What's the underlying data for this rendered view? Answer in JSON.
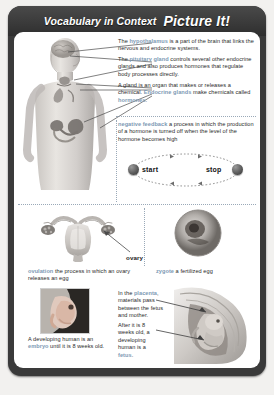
{
  "header": {
    "title_script": "Vocabulary in Context",
    "title_bold": "Picture It!"
  },
  "accent_colors": {
    "term_highlight": "#7d99b4",
    "frame": "#3a3a3a",
    "page": "#ffffff",
    "divider": "#9aa9b8"
  },
  "endocrine_section": {
    "entries": [
      {
        "id": "hypothalamus",
        "lead": "The ",
        "term": "hypothalamus",
        "body": " is a part of the brain that links the nervous and endocrine systems."
      },
      {
        "id": "pituitary-gland",
        "lead": "The ",
        "term": "pituitary gland",
        "body": " controls several other endocrine glands and also produces hormones that regulate body processes directly."
      },
      {
        "id": "gland",
        "lead": "A gland is an organ that makes or releases a chemical. ",
        "term": "Endocrine glands",
        "body": " make chemicals called ",
        "term2": "hormones",
        "body2": "."
      }
    ],
    "body_figure_label": "human-endocrine-system-figure"
  },
  "negative_feedback": {
    "term": "negative feedback",
    "definition": " a process in which the production of a hormone is turned off when the level of the hormone becomes high",
    "loop": {
      "start_label": "start",
      "stop_label": "stop"
    }
  },
  "reproduction_section": {
    "ovary_label": "ovary",
    "ovulation": {
      "term": "ovulation",
      "definition": " the process in which an ovary releases an egg"
    },
    "zygote": {
      "term": "zygote",
      "definition": " a fertilized egg"
    }
  },
  "development_section": {
    "placenta": {
      "lead": "In the ",
      "term": "placenta",
      "body": ", materials pass between the fetus and mother."
    },
    "fetus": {
      "lead": "After it is 8 weeks old, a developing human is a ",
      "term": "fetus",
      "body": "."
    },
    "embryo": {
      "lead": "A developing human is an ",
      "term": "embryo",
      "body": " until it is 8 weeks old."
    }
  },
  "footnote": ""
}
